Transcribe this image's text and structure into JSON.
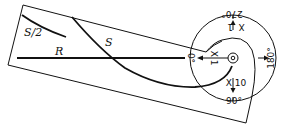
{
  "diagram": {
    "labels": {
      "s_half": "S/2",
      "r": "R",
      "s": "S",
      "zero_deg": "0°",
      "ninety_deg": "90°",
      "one_eighty_deg": "180°",
      "two_seventy_deg": "270°",
      "x1": "X 1",
      "x10": "X 10",
      "x_point1": "X .1"
    },
    "colors": {
      "stroke": "#111111",
      "background": "#ffffff"
    }
  }
}
